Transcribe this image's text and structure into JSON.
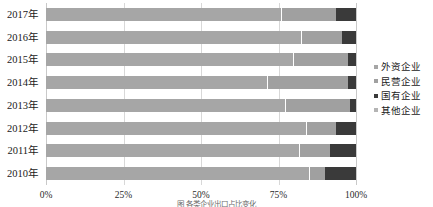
{
  "chart_data": {
    "type": "bar",
    "orientation": "horizontal",
    "stacked": true,
    "stack_mode": "percent",
    "title": "",
    "xlabel": "",
    "ylabel": "",
    "xlim": [
      0,
      100
    ],
    "xticks": [
      0,
      25,
      50,
      75,
      100
    ],
    "xtick_labels": [
      "0%",
      "25%",
      "50%",
      "75%",
      "100%"
    ],
    "grid": true,
    "grid_axis": "x",
    "legend_position": "right",
    "categories": [
      "2017年",
      "2016年",
      "2015年",
      "2014年",
      "2013年",
      "2012年",
      "2011年",
      "2010年"
    ],
    "series": [
      {
        "name": "外资企业",
        "color": "#a6a6a6",
        "values": [
          76.0,
          82.5,
          80.0,
          71.5,
          77.5,
          84.0,
          82.0,
          85.0
        ]
      },
      {
        "name": "民营企业",
        "color": "#a0a0a0",
        "values": [
          17.5,
          13.0,
          17.5,
          26.0,
          20.5,
          9.5,
          9.5,
          5.0
        ]
      },
      {
        "name": "国有企业",
        "color": "#3a3a3a",
        "values": [
          6.5,
          4.5,
          2.5,
          2.5,
          2.0,
          6.5,
          8.5,
          10.0
        ]
      },
      {
        "name": "其他企业",
        "color": "#b4b4b4",
        "values": [
          0,
          0,
          0,
          0,
          0,
          0,
          0,
          0
        ]
      }
    ]
  },
  "legend": {
    "items": [
      {
        "label": "外资企业",
        "color": "#a6a6a6"
      },
      {
        "label": "民营企业",
        "color": "#a0a0a0"
      },
      {
        "label": "国有企业",
        "color": "#3a3a3a"
      },
      {
        "label": "其他企业",
        "color": "#b4b4b4"
      }
    ]
  },
  "caption": {
    "text": "图 各类企业出口占比变化"
  }
}
